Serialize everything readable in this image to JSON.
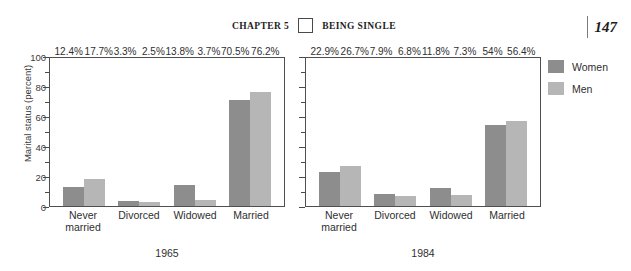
{
  "running_head": {
    "chapter": "CHAPTER 5",
    "title": "BEING SINGLE",
    "folio": "147"
  },
  "legend": {
    "items": [
      {
        "label": "Women",
        "color": "#8d8d8d"
      },
      {
        "label": "Men",
        "color": "#b6b6b6"
      }
    ]
  },
  "chart_data": {
    "type": "bar",
    "title": "",
    "xlabel": "",
    "ylabel": "Marital status (percent)",
    "ylim": [
      0,
      100
    ],
    "yticks": [
      0,
      20,
      40,
      60,
      80,
      100
    ],
    "ytick_labels": [
      "0",
      "20",
      "40",
      "60",
      "80",
      "100"
    ],
    "minor_yticks": [
      10,
      30,
      50,
      70,
      90
    ],
    "grid": false,
    "legend_position": "right",
    "categories": [
      "Never married",
      "Divorced",
      "Widowed",
      "Married"
    ],
    "panels": [
      {
        "name": "1965",
        "year_label": "1965",
        "show_y_axis_labels": true,
        "series": [
          {
            "name": "Women",
            "values": [
              12.4,
              3.3,
              13.8,
              70.5
            ],
            "labels": [
              "12.4%",
              "3.3%",
              "13.8%",
              "70.5%"
            ]
          },
          {
            "name": "Men",
            "values": [
              17.7,
              2.5,
              3.7,
              76.2
            ],
            "labels": [
              "17.7%",
              "2.5%",
              "3.7%",
              "76.2%"
            ]
          }
        ]
      },
      {
        "name": "1984",
        "year_label": "1984",
        "show_y_axis_labels": false,
        "series": [
          {
            "name": "Women",
            "values": [
              22.9,
              7.9,
              11.8,
              54.0
            ],
            "labels": [
              "22.9%",
              "7.9%",
              "11.8%",
              "54%"
            ]
          },
          {
            "name": "Men",
            "values": [
              26.7,
              6.8,
              7.3,
              56.4
            ],
            "labels": [
              "26.7%",
              "6.8%",
              "7.3%",
              "56.4%"
            ]
          }
        ]
      }
    ]
  }
}
